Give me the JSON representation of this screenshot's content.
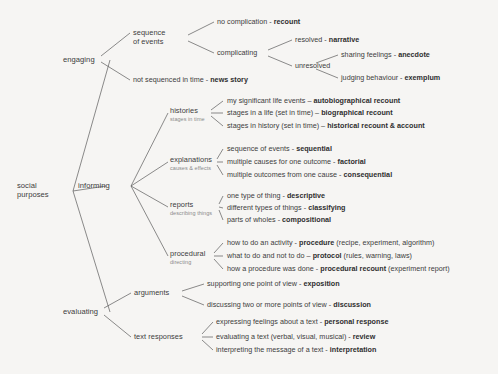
{
  "diagram": {
    "title": "social purposes",
    "type": "hierarchical-tree",
    "root": {
      "label_line1": "social",
      "label_line2": "purposes"
    },
    "branches": [
      {
        "id": "engaging",
        "label": "engaging",
        "children": [
          {
            "id": "sequence-of-events",
            "label_line1": "sequence",
            "label_line2": "of events",
            "children": [
              {
                "id": "no-complication",
                "desc": "no complication - ",
                "genre": "recount",
                "paren": ""
              },
              {
                "id": "complicating",
                "label": "complicating",
                "children": [
                  {
                    "id": "resolved",
                    "desc": "resolved - ",
                    "genre": "narrative",
                    "paren": ""
                  },
                  {
                    "id": "unresolved",
                    "label": "unresolved",
                    "children": [
                      {
                        "id": "anecdote",
                        "desc": "sharing feelings - ",
                        "genre": "anecdote",
                        "paren": ""
                      },
                      {
                        "id": "exemplum",
                        "desc": "judging behaviour - ",
                        "genre": "exemplum",
                        "paren": ""
                      }
                    ]
                  }
                ]
              }
            ]
          },
          {
            "id": "news-story",
            "desc": "not sequenced in time - ",
            "genre": "news story",
            "paren": ""
          }
        ]
      },
      {
        "id": "informing",
        "label": "informing",
        "children": [
          {
            "id": "histories",
            "label_line1": "histories",
            "sublabel": "stages in time",
            "children": [
              {
                "id": "autobiographical-recount",
                "desc": "my significant life events – ",
                "genre": "autobiographical recount",
                "paren": ""
              },
              {
                "id": "biographical-recount",
                "desc": "stages in a life (set in time) – ",
                "genre": "biographical recount",
                "paren": ""
              },
              {
                "id": "historical-recount-account",
                "desc": "stages in history (set in time) – ",
                "genre": "historical recount & account",
                "paren": ""
              }
            ]
          },
          {
            "id": "explanations",
            "label_line1": "explanations",
            "sublabel": "causes & effects",
            "children": [
              {
                "id": "sequential",
                "desc": "sequence of events - ",
                "genre": "sequential",
                "paren": ""
              },
              {
                "id": "factorial",
                "desc": "multiple causes for one outcome - ",
                "genre": "factorial",
                "paren": ""
              },
              {
                "id": "consequential",
                "desc": "multiple outcomes from one cause - ",
                "genre": "consequential",
                "paren": ""
              }
            ]
          },
          {
            "id": "reports",
            "label_line1": "reports",
            "sublabel": "describing things",
            "children": [
              {
                "id": "descriptive",
                "desc": "one type of thing - ",
                "genre": "descriptive",
                "paren": ""
              },
              {
                "id": "classifying",
                "desc": "different types of things - ",
                "genre": "classifying",
                "paren": ""
              },
              {
                "id": "compositional",
                "desc": "parts of wholes - ",
                "genre": "compositional",
                "paren": ""
              }
            ]
          },
          {
            "id": "procedural",
            "label_line1": "procedural",
            "sublabel": "directing",
            "children": [
              {
                "id": "procedure",
                "desc": "how to do an activity - ",
                "genre": "procedure",
                "paren": " (recipe, experiment, algorithm)"
              },
              {
                "id": "protocol",
                "desc": "what to do and not to do – ",
                "genre": "protocol",
                "paren": " (rules, warning, laws)"
              },
              {
                "id": "procedural-recount",
                "desc": "how a procedure was done - ",
                "genre": "procedural recount",
                "paren": " (experiment report)"
              }
            ]
          }
        ]
      },
      {
        "id": "evaluating",
        "label": "evaluating",
        "children": [
          {
            "id": "arguments",
            "label_line1": "arguments",
            "children": [
              {
                "id": "exposition",
                "desc": "supporting one point of view - ",
                "genre": "exposition",
                "paren": ""
              },
              {
                "id": "discussion",
                "desc": "discussing two or more points of view - ",
                "genre": "discussion",
                "paren": ""
              }
            ]
          },
          {
            "id": "text-responses",
            "label_line1": "text responses",
            "children": [
              {
                "id": "personal-response",
                "desc": "expressing feelings about a text - ",
                "genre": "personal response",
                "paren": ""
              },
              {
                "id": "review",
                "desc": "evaluating a text (verbal, visual, musical) - ",
                "genre": "review",
                "paren": ""
              },
              {
                "id": "interpretation",
                "desc": "interpreting the message of a text - ",
                "genre": "interpretation",
                "paren": ""
              }
            ]
          }
        ]
      }
    ]
  }
}
